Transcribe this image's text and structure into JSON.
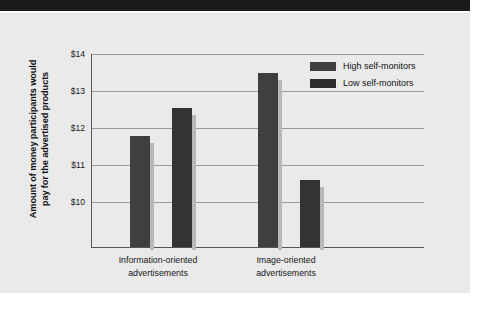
{
  "figure": {
    "banner_label": "top-black-banner",
    "background_color": "#eaeaea"
  },
  "chart_data": {
    "type": "bar",
    "title": "",
    "subtitle": "",
    "xlabel": "",
    "ylabel": "Amount of money participants would pay for the advertised products",
    "ylabel_line1": "Amount of money participants would",
    "ylabel_line2": "pay for the advertised products",
    "categories": [
      "Information-oriented advertisements",
      "Image-oriented advertisements"
    ],
    "category_lines": [
      [
        "Information-oriented",
        "advertisements"
      ],
      [
        "Image-oriented",
        "advertisements"
      ]
    ],
    "series": [
      {
        "name": "High self-monitors",
        "values": [
          12.35,
          14.05
        ],
        "color": "#3f3f3f"
      },
      {
        "name": "Low self-monitors",
        "values": [
          13.1,
          11.15
        ],
        "color": "#2e2e2e"
      }
    ],
    "ylim": [
      9.35,
      14.0
    ],
    "yticks": [
      10,
      11,
      12,
      13,
      14
    ],
    "ytick_labels": [
      "$10",
      "$11",
      "$12",
      "$13",
      "$14"
    ],
    "grid": true,
    "legend_position": "upper right"
  },
  "legend": {
    "items": [
      {
        "label": "High self-monitors"
      },
      {
        "label": "Low self-monitors"
      }
    ]
  }
}
